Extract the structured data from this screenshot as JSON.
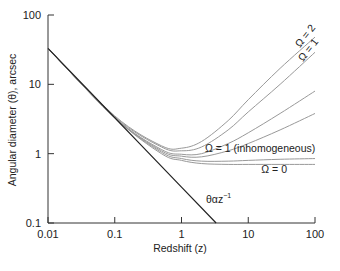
{
  "chart_data": {
    "type": "line",
    "title": "",
    "xlabel": "Redshift (z)",
    "ylabel": "Angular diameter (θ), arcsec",
    "xscale": "log",
    "yscale": "log",
    "xlim": [
      0.01,
      100
    ],
    "ylim": [
      0.1,
      100
    ],
    "x_ticks": [
      "0.01",
      "0.1",
      "1",
      "10",
      "100"
    ],
    "y_ticks": [
      "0.1",
      "1",
      "10",
      "100"
    ],
    "grid": false,
    "series": [
      {
        "name": "θ ∝ z⁻¹",
        "label": "θαz⁻¹",
        "color": "#222222",
        "x": [
          0.01,
          0.1,
          1,
          3.3
        ],
        "y": [
          33,
          3.3,
          0.33,
          0.1
        ]
      },
      {
        "name": "Ω = 2",
        "label": "Ω = 2",
        "color": "#999999",
        "x": [
          0.01,
          0.1,
          0.5,
          1,
          2,
          5,
          10,
          30,
          100
        ],
        "y": [
          33,
          3.5,
          1.3,
          1.2,
          1.5,
          3,
          6,
          17,
          48
        ]
      },
      {
        "name": "Ω = 1",
        "label": "Ω = 1",
        "color": "#999999",
        "x": [
          0.01,
          0.1,
          0.5,
          1,
          2,
          5,
          10,
          30,
          100
        ],
        "y": [
          33,
          3.4,
          1.25,
          1.1,
          1.25,
          2.2,
          4,
          10,
          29
        ]
      },
      {
        "name": "curve-3",
        "label": "",
        "color": "#999999",
        "x": [
          0.01,
          0.1,
          0.5,
          1,
          2,
          5,
          10,
          30,
          100
        ],
        "y": [
          33,
          3.3,
          1.15,
          0.98,
          1.0,
          1.4,
          2.0,
          3.8,
          8
        ]
      },
      {
        "name": "curve-4",
        "label": "",
        "color": "#999999",
        "x": [
          0.01,
          0.1,
          0.5,
          1,
          2,
          5,
          10,
          30,
          100
        ],
        "y": [
          33,
          3.3,
          1.1,
          0.92,
          0.9,
          1.1,
          1.4,
          2.2,
          3.8
        ]
      },
      {
        "name": "Ω = 1 (inhomogeneous)",
        "label": "Ω = 1 (inhomogeneous)",
        "color": "#999999",
        "x": [
          0.01,
          0.1,
          0.5,
          1,
          2,
          5,
          10,
          30,
          100
        ],
        "y": [
          33,
          3.3,
          1.05,
          0.85,
          0.78,
          0.78,
          0.8,
          0.83,
          0.85
        ]
      },
      {
        "name": "Ω = 0",
        "label": "Ω = 0",
        "color": "#999999",
        "x": [
          0.01,
          0.1,
          0.5,
          1,
          2,
          5,
          10,
          30,
          100
        ],
        "y": [
          33,
          3.3,
          1.0,
          0.8,
          0.72,
          0.7,
          0.7,
          0.7,
          0.7
        ]
      }
    ],
    "annotations": [
      "Ω = 2",
      "Ω = 1",
      "Ω = 1 (inhomogeneous)",
      "Ω = 0",
      "θαz⁻¹"
    ]
  },
  "labels": {
    "xlabel": "Redshift (z)",
    "ylabel": "Angular diameter (θ), arcsec",
    "omega2": "Ω = 2",
    "omega1": "Ω = 1",
    "omega1_inhom": "Ω = 1 (inhomogeneous)",
    "omega0": "Ω = 0",
    "power_law": "θαz",
    "power_law_exp": "−1"
  }
}
